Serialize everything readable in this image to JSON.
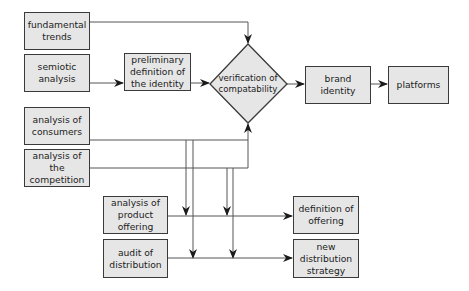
{
  "diagram": {
    "colors": {
      "box_fill": "#e6e6e6",
      "stroke": "#3a3a3a",
      "line": "#555555"
    },
    "nodes": {
      "fundamental_trends": "fundamental trends",
      "semiotic_analysis": "semiotic analysis",
      "preliminary_definition": "preliminary definition of the identity",
      "verification": "verification of compatability",
      "brand_identity": "brand identity",
      "platforms": "platforms",
      "analysis_consumers": "analysis of consumers",
      "analysis_competition": "analysis of the competition",
      "analysis_product_offering": "analysis of product offering",
      "audit_distribution": "audit of distribution",
      "definition_offering": "definition of offering",
      "new_distribution_strategy": "new distribution strategy"
    },
    "edges": [
      {
        "from": "fundamental trends",
        "to": "verification of compatability"
      },
      {
        "from": "semiotic analysis",
        "to": "preliminary definition of the identity"
      },
      {
        "from": "preliminary definition of the identity",
        "to": "verification of compatability"
      },
      {
        "from": "verification of compatability",
        "to": "brand identity"
      },
      {
        "from": "brand identity",
        "to": "platforms"
      },
      {
        "from": "analysis of consumers",
        "to": "verification of compatability"
      },
      {
        "from": "analysis of the competition",
        "to": "verification of compatability"
      },
      {
        "from": "analysis of consumers",
        "to": "analysis of product offering line"
      },
      {
        "from": "analysis of consumers",
        "to": "audit of distribution line"
      },
      {
        "from": "analysis of the competition",
        "to": "analysis of product offering line"
      },
      {
        "from": "analysis of the competition",
        "to": "audit of distribution line"
      },
      {
        "from": "analysis of product offering",
        "to": "definition of offering"
      },
      {
        "from": "audit of distribution",
        "to": "new distribution strategy"
      }
    ]
  }
}
